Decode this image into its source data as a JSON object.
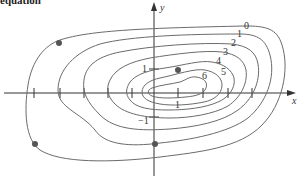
{
  "caption": "equation",
  "axes": {
    "x_label": "x",
    "y_label": "y",
    "x_ticks_px": [
      34,
      60,
      84,
      108,
      132,
      178,
      203,
      228,
      252
    ],
    "y_tick_labels": {
      "upper": "1",
      "lower": "−1"
    },
    "x_tick_label_right": "1"
  },
  "colors": {
    "curve": "#6b6b6b",
    "axis": "#333333",
    "dot": "#555555"
  },
  "contours": [
    {
      "level": "0",
      "label": "0"
    },
    {
      "level": "1",
      "label": "1"
    },
    {
      "level": "2",
      "label": "2"
    },
    {
      "level": "3",
      "label": "3"
    },
    {
      "level": "4",
      "label": "4"
    },
    {
      "level": "5",
      "label": "5"
    },
    {
      "level": "6",
      "label": "6"
    }
  ],
  "points": [
    {
      "x": 59,
      "y": 43
    },
    {
      "x": 35,
      "y": 144
    },
    {
      "x": 155,
      "y": 144
    },
    {
      "x": 178,
      "y": 70
    }
  ]
}
